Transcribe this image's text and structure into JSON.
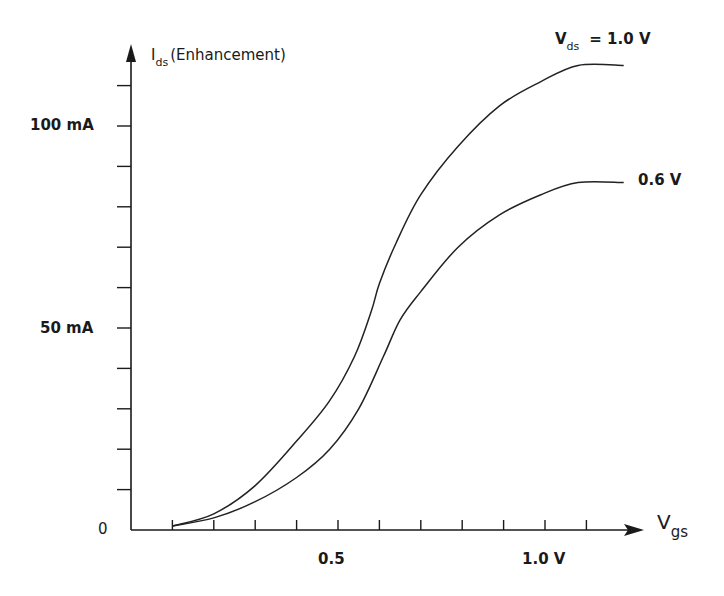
{
  "chart_data": {
    "type": "line",
    "title": "",
    "xlabel": "Vgs",
    "xlabel_main": "V",
    "xlabel_sub": "gs",
    "ylabel": "Ids (Enhancement)",
    "ylabel_main": "I",
    "ylabel_sub": "ds",
    "ylabel_suffix": "(Enhancement)",
    "x_ticks": [
      0.1,
      0.2,
      0.3,
      0.4,
      0.5,
      0.6,
      0.7,
      0.8,
      0.9,
      1.0,
      1.1
    ],
    "x_tick_labels": [
      {
        "value": 0.5,
        "label": "0.5"
      },
      {
        "value": 1.0,
        "label": "1.0 V"
      }
    ],
    "y_ticks": [
      10,
      20,
      30,
      40,
      50,
      60,
      70,
      80,
      90,
      100,
      110
    ],
    "y_tick_labels": [
      {
        "value": 0,
        "label": "0"
      },
      {
        "value": 50,
        "label": "50 mA"
      },
      {
        "value": 100,
        "label": "100 mA"
      }
    ],
    "xlim": [
      0,
      1.25
    ],
    "ylim": [
      0,
      115
    ],
    "grid": false,
    "series": [
      {
        "name": "Vds = 1.0 V",
        "label_main": "V",
        "label_sub": "ds",
        "label_suffix": "= 1.0 V",
        "x": [
          0.1,
          0.2,
          0.3,
          0.4,
          0.48,
          0.54,
          0.58,
          0.6,
          0.64,
          0.7,
          0.79,
          0.89,
          0.99,
          1.08,
          1.19
        ],
        "y": [
          1,
          4,
          11,
          22,
          32,
          43,
          54,
          61,
          71,
          83,
          95,
          105,
          111,
          115,
          115
        ]
      },
      {
        "name": "Vds = 0.6 V",
        "label_suffix": "0.6 V",
        "x": [
          0.1,
          0.2,
          0.3,
          0.4,
          0.48,
          0.55,
          0.61,
          0.65,
          0.7,
          0.79,
          0.89,
          0.99,
          1.08,
          1.19
        ],
        "y": [
          1,
          3,
          7,
          13,
          20,
          30,
          43,
          52,
          59,
          70,
          78,
          83,
          86,
          86
        ]
      }
    ]
  },
  "labels": {
    "y_axis_main": "I",
    "y_axis_sub": "ds",
    "y_axis_suffix": "(Enhancement)",
    "x_axis_main": "V",
    "x_axis_sub": "gs",
    "tick_100": "100 mA",
    "tick_50": "50 mA",
    "tick_0": "0",
    "tick_05": "0.5",
    "tick_10": "1.0 V",
    "series1_main": "V",
    "series1_sub": "ds",
    "series1_suffix": "= 1.0 V",
    "series2": "0.6 V"
  }
}
